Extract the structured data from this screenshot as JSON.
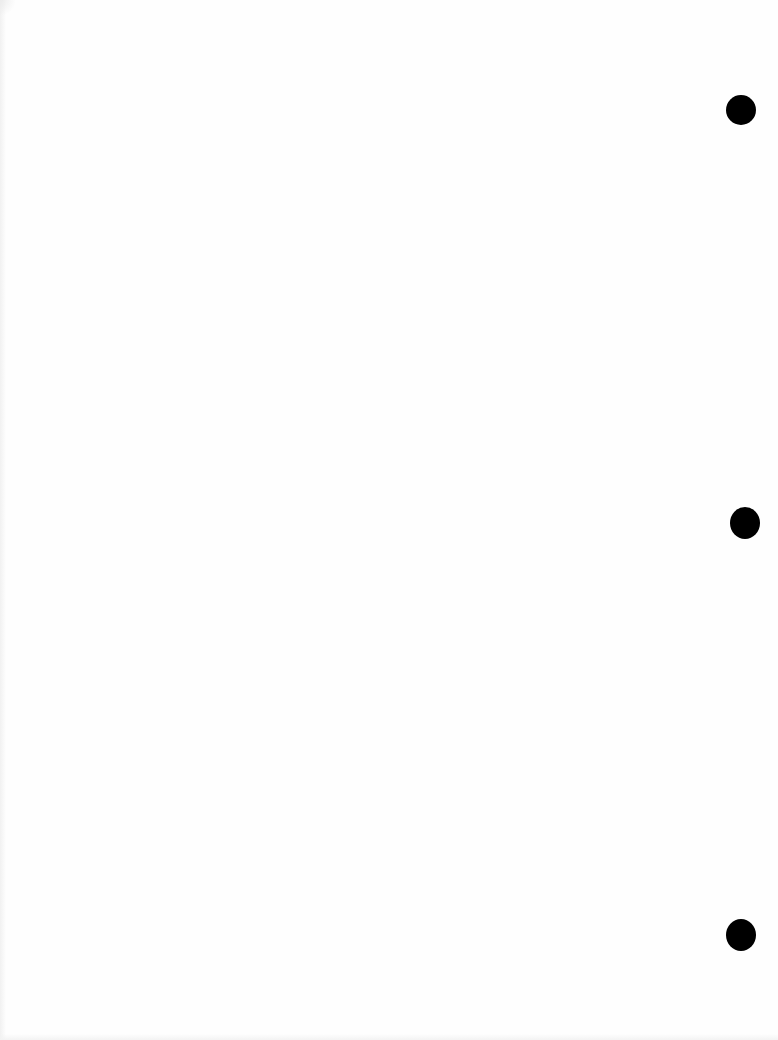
{
  "page": {
    "type": "blank scanned page",
    "background_color": "#fefefe",
    "punch_holes": [
      {
        "cx": 741,
        "cy": 110,
        "w": 30,
        "h": 30
      },
      {
        "cx": 745,
        "cy": 523,
        "w": 30,
        "h": 32
      },
      {
        "cx": 741,
        "cy": 935,
        "w": 30,
        "h": 32
      }
    ],
    "hole_color": "#000000"
  }
}
